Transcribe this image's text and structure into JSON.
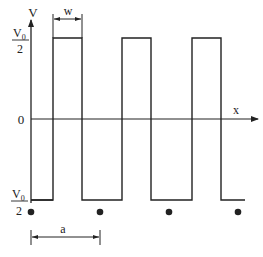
{
  "diagram": {
    "type": "square-wave potential",
    "axes": {
      "y_label": "V",
      "x_label": "x",
      "origin_label": "0"
    },
    "levels": {
      "top": {
        "numerator": "V0",
        "num_main": "V",
        "num_sub": "0",
        "denominator": "2"
      },
      "bottom": {
        "numerator": "V0",
        "num_main": "V",
        "num_sub": "0",
        "denominator": "2"
      }
    },
    "dimensions": {
      "pulse_width_label": "w",
      "period_label": "a"
    },
    "pulse_count": 3,
    "dot_count": 4,
    "colors": {
      "line": "#222222",
      "background": "#ffffff"
    }
  }
}
